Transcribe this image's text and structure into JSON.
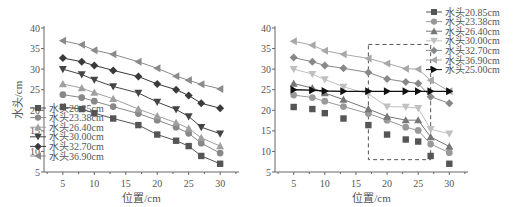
{
  "chart_data": [
    {
      "type": "line",
      "title": "",
      "xlabel": "位置/cm",
      "ylabel": "水头/cm",
      "xlim": [
        2,
        33
      ],
      "ylim": [
        5,
        40
      ],
      "xticks": [
        5,
        10,
        15,
        20,
        25,
        30
      ],
      "yticks": [
        5,
        10,
        15,
        20,
        25,
        30,
        35,
        40
      ],
      "grid": false,
      "legend_position": "inside lower left",
      "x": [
        5,
        8,
        10,
        13,
        17,
        20,
        23,
        25,
        27,
        30
      ],
      "series": [
        {
          "name": "水头20.85cm",
          "marker": "square",
          "color": "#555555",
          "values": [
            20.8,
            20.3,
            19.3,
            18.0,
            16.4,
            14.1,
            12.6,
            11.3,
            8.9,
            7.0
          ]
        },
        {
          "name": "水头23.38cm",
          "marker": "circle",
          "color": "#888888",
          "values": [
            23.8,
            23.1,
            22.2,
            20.9,
            19.2,
            17.6,
            15.9,
            14.4,
            12.0,
            9.6
          ]
        },
        {
          "name": "水头26.40cm",
          "marker": "triangle-up",
          "color": "#a0a0a0",
          "values": [
            26.4,
            25.4,
            24.3,
            22.8,
            20.3,
            18.6,
            17.0,
            15.6,
            13.3,
            11.3
          ]
        },
        {
          "name": "水头30.00cm",
          "marker": "triangle-down",
          "color": "#444444",
          "values": [
            30.0,
            28.7,
            27.4,
            25.8,
            24.2,
            22.0,
            20.2,
            18.5,
            15.9,
            14.3
          ]
        },
        {
          "name": "水头32.70cm",
          "marker": "diamond",
          "color": "#3a3a3a",
          "values": [
            32.7,
            31.8,
            30.9,
            29.7,
            28.2,
            26.4,
            25.0,
            23.6,
            21.7,
            20.5
          ]
        },
        {
          "name": "水头36.90cm",
          "marker": "triangle-left",
          "color": "#8a8a8a",
          "values": [
            36.9,
            35.9,
            34.6,
            33.6,
            31.8,
            30.2,
            28.3,
            27.3,
            26.3,
            25.2
          ]
        }
      ]
    },
    {
      "type": "line",
      "title": "",
      "xlabel": "位置/cm",
      "ylabel": "水头/cm",
      "xlim": [
        2,
        33
      ],
      "ylim": [
        5,
        40
      ],
      "xticks": [
        5,
        10,
        15,
        20,
        25,
        30
      ],
      "yticks": [
        5,
        10,
        15,
        20,
        25,
        30,
        35,
        40
      ],
      "grid": false,
      "legend_position": "outside upper right",
      "annotations": [
        {
          "type": "dashed-rectangle",
          "x_range": [
            17,
            27
          ],
          "y_range": [
            8,
            36
          ]
        }
      ],
      "x": [
        5,
        8,
        10,
        13,
        17,
        20,
        23,
        25,
        27,
        30
      ],
      "series": [
        {
          "name": "水头20.85cm",
          "marker": "square",
          "color": "#555555",
          "line": false,
          "values": [
            20.8,
            20.3,
            19.3,
            18.0,
            16.4,
            14.1,
            12.9,
            12.4,
            8.9,
            7.0
          ]
        },
        {
          "name": "水头23.38cm",
          "marker": "circle",
          "color": "#999999",
          "values": [
            23.7,
            23.1,
            22.2,
            20.9,
            19.2,
            17.6,
            15.9,
            15.1,
            11.8,
            9.7
          ]
        },
        {
          "name": "水头26.40cm",
          "marker": "triangle-up",
          "color": "#777777",
          "values": [
            26.5,
            25.4,
            24.2,
            22.6,
            20.3,
            18.5,
            17.6,
            17.6,
            13.5,
            11.2
          ]
        },
        {
          "name": "水头30.00cm",
          "marker": "triangle-down",
          "color": "#c0c0c0",
          "values": [
            30.0,
            28.8,
            27.5,
            25.7,
            24.0,
            20.9,
            20.8,
            20.5,
            15.4,
            14.3
          ]
        },
        {
          "name": "水头32.70cm",
          "marker": "diamond",
          "color": "#888888",
          "values": [
            32.8,
            31.8,
            30.9,
            30.2,
            29.2,
            27.6,
            26.9,
            26.5,
            23.3,
            21.7
          ]
        },
        {
          "name": "水头36.90cm",
          "marker": "triangle-left",
          "color": "#a8a8a8",
          "values": [
            36.8,
            35.8,
            34.5,
            33.6,
            32.6,
            31.4,
            30.1,
            30.0,
            27.3,
            24.6
          ]
        },
        {
          "name": "水头25.00cm",
          "marker": "triangle-right",
          "color": "#111111",
          "values": [
            25.0,
            24.9,
            24.7,
            24.6,
            24.6,
            24.6,
            24.6,
            24.6,
            24.6,
            24.6
          ]
        }
      ]
    }
  ]
}
